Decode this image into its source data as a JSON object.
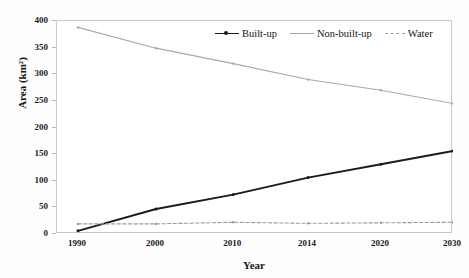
{
  "chart_data": {
    "type": "line",
    "title": "",
    "xlabel": "Year",
    "ylabel": "Area (km²)",
    "categories": [
      "1990",
      "2000",
      "2010",
      "2014",
      "2020",
      "2030"
    ],
    "x": [
      1990,
      2000,
      2010,
      2014,
      2020,
      2030
    ],
    "ylim": [
      0,
      400
    ],
    "yticks": [
      0,
      50,
      100,
      150,
      200,
      250,
      300,
      350,
      400
    ],
    "ytick_labels": [
      "0",
      "50",
      "100",
      "150",
      "200",
      "250",
      "300",
      "350",
      "400"
    ],
    "grid": false,
    "legend_position": "top-right-inside",
    "series": [
      {
        "name": "Built-up",
        "values": [
          6,
          47,
          74,
          106,
          131,
          156
        ],
        "color": "#1b1b1b",
        "style": "solid",
        "marker": "dot"
      },
      {
        "name": "Non-built-up",
        "values": [
          388,
          349,
          320,
          290,
          270,
          245
        ],
        "color": "#a8a8a8",
        "style": "solid",
        "marker": "dot"
      },
      {
        "name": "Water",
        "values": [
          19,
          19,
          22,
          20,
          21,
          22
        ],
        "color": "#9a9a9a",
        "style": "dashed",
        "marker": "dot"
      }
    ]
  },
  "legend": {
    "items": [
      {
        "label": "Built-up"
      },
      {
        "label": "Non-built-up"
      },
      {
        "label": "Water"
      }
    ]
  },
  "axes": {
    "x_title": "Year",
    "y_title": "Area (km²)"
  }
}
